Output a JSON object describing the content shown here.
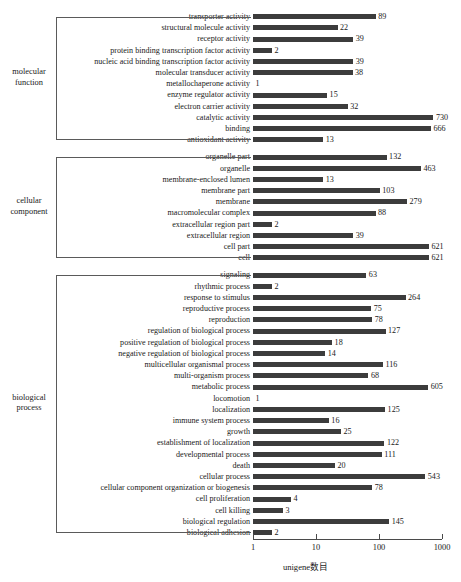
{
  "chart_data": {
    "type": "bar",
    "orientation": "horizontal",
    "title": "",
    "xlabel": "unigene数目",
    "ylabel": "",
    "xscale": "log",
    "xlim": [
      1,
      1000
    ],
    "xticks": [
      1,
      10,
      100,
      1000
    ],
    "xtick_labels": [
      "1",
      "10",
      "100",
      "1000"
    ],
    "grid": false,
    "legend": null,
    "bar_color": "#3c3c3c",
    "groups": [
      {
        "name": "molecular function",
        "label": "molecular\nfunction",
        "categories": [
          "transporter activity",
          "structural molecule activity",
          "receptor activity",
          "protein binding transcription factor activity",
          "nucleic acid binding transcription factor activity",
          "molecular transducer activity",
          "metallochaperone activity",
          "enzyme regulator activity",
          "electron carrier activity",
          "catalytic activity",
          "binding",
          "antioxidant activity"
        ],
        "values": [
          89,
          22,
          39,
          2,
          39,
          38,
          1,
          15,
          32,
          730,
          666,
          13
        ]
      },
      {
        "name": "cellular component",
        "label": "cellular\ncomponent",
        "categories": [
          "organelle part",
          "organelle",
          "membrane-enclosed lumen",
          "membrane part",
          "membrane",
          "macromolecular complex",
          "extracellular region part",
          "extracellular region",
          "cell part",
          "cell"
        ],
        "values": [
          132,
          463,
          13,
          103,
          279,
          88,
          2,
          39,
          621,
          621
        ]
      },
      {
        "name": "biological process",
        "label": "biological\nprocess",
        "categories": [
          "signaling",
          "rhythmic process",
          "response to stimulus",
          "reproductive process",
          "reproduction",
          "regulation of biological process",
          "positive regulation of biological process",
          "negative regulation of biological process",
          "multicellular organismal process",
          "multi-organism process",
          "metabolic process",
          "locomotion",
          "localization",
          "immune system process",
          "growth",
          "establishment of localization",
          "developmental process",
          "death",
          "cellular process",
          "cellular component organization or biogenesis",
          "cell proliferation",
          "cell killing",
          "biological regulation",
          "biological adhesion"
        ],
        "values": [
          63,
          2,
          264,
          75,
          78,
          127,
          18,
          14,
          116,
          68,
          605,
          1,
          125,
          16,
          25,
          122,
          111,
          20,
          543,
          78,
          4,
          3,
          145,
          2
        ]
      }
    ]
  }
}
